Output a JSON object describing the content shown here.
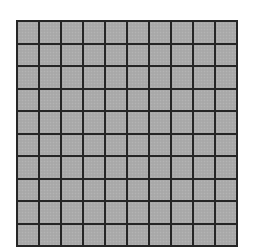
{
  "figure": {
    "type": "grid",
    "rows": 10,
    "columns": 10,
    "cell_fill_color": "#ababab",
    "line_color": "#262626",
    "background_color": "#ffffff"
  }
}
